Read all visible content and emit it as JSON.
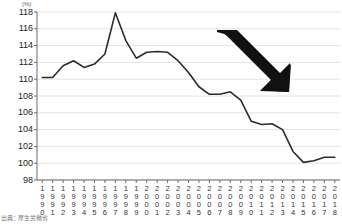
{
  "chart_data": {
    "type": "line",
    "title": "",
    "xlabel": "",
    "ylabel": "(%)",
    "ylim": [
      98,
      118
    ],
    "ytick_step": 2,
    "yticks": [
      118,
      116,
      114,
      112,
      110,
      108,
      106,
      104,
      102,
      100,
      98
    ],
    "grid": true,
    "legend": "none",
    "line_color": "#2b2b2b",
    "categories": [
      "1990",
      "1991",
      "1992",
      "1993",
      "1994",
      "1995",
      "1996",
      "1997",
      "1998",
      "1999",
      "2000",
      "2001",
      "2002",
      "2003",
      "2004",
      "2005",
      "2006",
      "2007",
      "2008",
      "2009",
      "2010",
      "2011",
      "2012",
      "2013",
      "2014",
      "2015",
      "2016",
      "2017",
      "2018"
    ],
    "values": [
      110.2,
      110.2,
      111.6,
      112.2,
      111.4,
      111.8,
      113.0,
      117.9,
      114.6,
      112.5,
      113.2,
      113.3,
      113.2,
      112.2,
      110.8,
      109.1,
      108.2,
      108.2,
      108.5,
      107.5,
      105.0,
      104.6,
      104.7,
      104.0,
      101.4,
      100.1,
      100.3,
      100.7,
      100.7
    ],
    "annotations": [
      {
        "name": "decline-arrow",
        "shape": "arrow",
        "direction": "down-right",
        "color": "#111111"
      }
    ]
  },
  "source": {
    "note": "出典：厚生労働省"
  }
}
